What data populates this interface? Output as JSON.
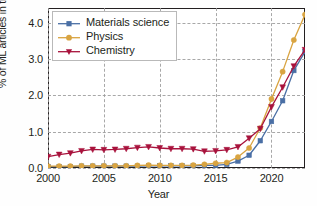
{
  "chart_data": {
    "type": "line",
    "title": "",
    "xlabel": "Year",
    "ylabel": "% of ML articles in the field",
    "xlim": [
      2000,
      2023
    ],
    "ylim": [
      0.0,
      4.4
    ],
    "xticks": [
      2000,
      2005,
      2010,
      2015,
      2020
    ],
    "xtick_labels": [
      "2000",
      "2005",
      "2010",
      "2015",
      "2020"
    ],
    "yticks": [
      0.0,
      1.0,
      2.0,
      3.0,
      4.0
    ],
    "ytick_labels": [
      "0.0",
      "1.0",
      "2.0",
      "3.0",
      "4.0"
    ],
    "grid": true,
    "grid_style": "dashed",
    "legend_position": "upper left",
    "x": [
      2000,
      2001,
      2002,
      2003,
      2004,
      2005,
      2006,
      2007,
      2008,
      2009,
      2010,
      2011,
      2012,
      2013,
      2014,
      2015,
      2016,
      2017,
      2018,
      2019,
      2020,
      2021,
      2022,
      2023
    ],
    "series": [
      {
        "name": "Materials science",
        "color": "#4A6FA5",
        "marker": "square",
        "values": [
          0.04,
          0.04,
          0.04,
          0.05,
          0.05,
          0.05,
          0.05,
          0.05,
          0.05,
          0.06,
          0.06,
          0.06,
          0.06,
          0.06,
          0.07,
          0.07,
          0.1,
          0.19,
          0.35,
          0.75,
          1.28,
          1.85,
          2.68,
          3.2
        ]
      },
      {
        "name": "Physics",
        "color": "#D9A441",
        "marker": "circle",
        "values": [
          0.05,
          0.05,
          0.05,
          0.06,
          0.06,
          0.06,
          0.06,
          0.06,
          0.07,
          0.08,
          0.07,
          0.07,
          0.07,
          0.08,
          0.1,
          0.13,
          0.15,
          0.3,
          0.55,
          1.1,
          1.9,
          2.65,
          3.52,
          4.22
        ]
      },
      {
        "name": "Chemistry",
        "color": "#A8123C",
        "marker": "triangle-down",
        "values": [
          0.31,
          0.37,
          0.41,
          0.47,
          0.51,
          0.5,
          0.51,
          0.53,
          0.56,
          0.58,
          0.55,
          0.53,
          0.53,
          0.52,
          0.46,
          0.47,
          0.5,
          0.58,
          0.82,
          1.08,
          1.68,
          2.22,
          2.8,
          3.25
        ]
      }
    ]
  }
}
